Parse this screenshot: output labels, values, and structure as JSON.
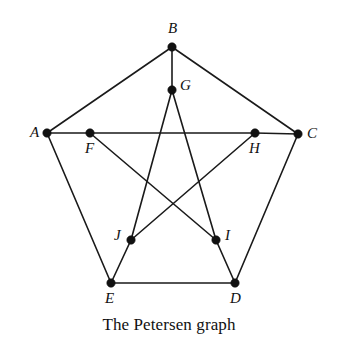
{
  "figure": {
    "title": "The Petersen graph",
    "caption": "The Petersen graph",
    "background_color": "#ffffff",
    "stroke_color": "#1a1a1a",
    "vertex_color": "#111111",
    "width": 338,
    "height": 349
  },
  "chart_data": {
    "type": "diagram",
    "subtype": "graph-drawing",
    "title": "The Petersen graph",
    "vertex_count": 10,
    "edge_count": 15,
    "regularity": 3,
    "nodes": [
      {
        "id": "A",
        "label": "A",
        "x": 47,
        "y": 133,
        "ring": "outer",
        "label_dx": -17,
        "label_dy": -8
      },
      {
        "id": "B",
        "label": "B",
        "x": 172,
        "y": 47,
        "ring": "outer",
        "label_dx": -4,
        "label_dy": -26
      },
      {
        "id": "C",
        "label": "C",
        "x": 298,
        "y": 134,
        "ring": "outer",
        "label_dx": 9,
        "label_dy": -8
      },
      {
        "id": "D",
        "label": "D",
        "x": 235,
        "y": 283,
        "ring": "outer",
        "label_dx": -5,
        "label_dy": 8
      },
      {
        "id": "E",
        "label": "E",
        "x": 111,
        "y": 283,
        "ring": "outer",
        "label_dx": -6,
        "label_dy": 8
      },
      {
        "id": "F",
        "label": "F",
        "x": 90,
        "y": 133,
        "ring": "inner",
        "label_dx": -5,
        "label_dy": 8
      },
      {
        "id": "G",
        "label": "G",
        "x": 172,
        "y": 90,
        "ring": "inner",
        "label_dx": 8,
        "label_dy": -12
      },
      {
        "id": "H",
        "label": "H",
        "x": 255,
        "y": 133,
        "ring": "inner",
        "label_dx": -6,
        "label_dy": 8
      },
      {
        "id": "I",
        "label": "I",
        "x": 216,
        "y": 240,
        "ring": "inner",
        "label_dx": 9,
        "label_dy": -12
      },
      {
        "id": "J",
        "label": "J",
        "x": 131,
        "y": 240,
        "ring": "inner",
        "label_dx": -17,
        "label_dy": -12
      }
    ],
    "edges": [
      {
        "from": "A",
        "to": "B",
        "group": "outer-cycle"
      },
      {
        "from": "B",
        "to": "C",
        "group": "outer-cycle"
      },
      {
        "from": "C",
        "to": "D",
        "group": "outer-cycle"
      },
      {
        "from": "D",
        "to": "E",
        "group": "outer-cycle"
      },
      {
        "from": "E",
        "to": "A",
        "group": "outer-cycle"
      },
      {
        "from": "A",
        "to": "F",
        "group": "spoke"
      },
      {
        "from": "B",
        "to": "G",
        "group": "spoke"
      },
      {
        "from": "C",
        "to": "H",
        "group": "spoke"
      },
      {
        "from": "D",
        "to": "I",
        "group": "spoke"
      },
      {
        "from": "E",
        "to": "J",
        "group": "spoke"
      },
      {
        "from": "F",
        "to": "I",
        "group": "inner-pentagram"
      },
      {
        "from": "I",
        "to": "G",
        "group": "inner-pentagram"
      },
      {
        "from": "G",
        "to": "J",
        "group": "inner-pentagram"
      },
      {
        "from": "J",
        "to": "H",
        "group": "inner-pentagram"
      },
      {
        "from": "H",
        "to": "F",
        "group": "inner-pentagram"
      }
    ]
  }
}
